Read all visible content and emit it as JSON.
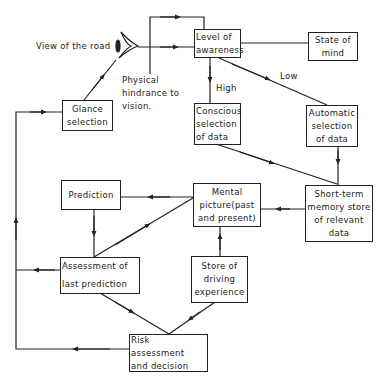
{
  "diagram": {
    "type": "flowchart",
    "nodes": {
      "view_of_road": "View of the road",
      "hindrance": "Physical\nhindrance to\nvision.",
      "level_of_awareness": "Level of\nawareness",
      "state_of_mind": "State of\nmind",
      "glance_selection": "Glance\nselection",
      "conscious_selection": "Conscious\nselection\nof data",
      "automatic_selection": "Automatic\nselection\nof  data",
      "mental_picture": "Mental\npicture(past\nand present)",
      "short_term_memory": "Short-term\nmemory store\nof  relevant\ndata",
      "prediction": "Prediction",
      "assessment_last_prediction": "Assessment of\n\nlast prediction",
      "store_driving_experience": "Store of\ndriving\nexperience",
      "risk_assessment": "Risk assessment\nand decision"
    },
    "edge_labels": {
      "high": "High",
      "low": "Low"
    },
    "edges": [
      {
        "from": "view_of_road",
        "to": "level_of_awareness"
      },
      {
        "from": "state_of_mind",
        "to": "level_of_awareness"
      },
      {
        "from": "level_of_awareness",
        "to": "conscious_selection",
        "label": "High"
      },
      {
        "from": "level_of_awareness",
        "to": "automatic_selection",
        "label": "Low"
      },
      {
        "from": "conscious_selection",
        "to": "short_term_memory"
      },
      {
        "from": "automatic_selection",
        "to": "short_term_memory"
      },
      {
        "from": "short_term_memory",
        "to": "mental_picture"
      },
      {
        "from": "mental_picture",
        "to": "prediction"
      },
      {
        "from": "mental_picture",
        "to": "assessment_last_prediction"
      },
      {
        "from": "prediction",
        "to": "assessment_last_prediction"
      },
      {
        "from": "store_driving_experience",
        "to": "mental_picture"
      },
      {
        "from": "assessment_last_prediction",
        "to": "risk_assessment"
      },
      {
        "from": "store_driving_experience",
        "to": "risk_assessment"
      },
      {
        "from": "risk_assessment",
        "to": "glance_selection"
      },
      {
        "from": "assessment_last_prediction",
        "to": "glance_selection"
      },
      {
        "from": "glance_selection",
        "to": "view_of_road"
      },
      {
        "from": "view_of_road",
        "to": "level_of_awareness",
        "via": "top-loop"
      }
    ]
  }
}
